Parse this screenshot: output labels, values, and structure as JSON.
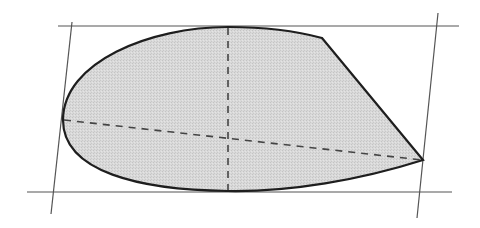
{
  "diagram": {
    "colors": {
      "background": "#ffffff",
      "shape_fill": "#d6d6d6",
      "shape_outline": "#1e1e1e",
      "frame_lines": "#555555",
      "axis_dash": "#444444"
    },
    "frame": {
      "top_line": {
        "x1": 58,
        "y1": 26,
        "x2": 459,
        "y2": 26
      },
      "bottom_line": {
        "x1": 27,
        "y1": 192,
        "x2": 452,
        "y2": 192
      },
      "left_line": {
        "x1": 72,
        "y1": 22,
        "x2": 51,
        "y2": 214
      },
      "right_line": {
        "x1": 438,
        "y1": 13,
        "x2": 417,
        "y2": 218
      }
    },
    "shape": {
      "path": "M 63 120 C 63 62 150 27 228 27 C 270 27 300 32 322 38 L 423 160 C 360 180 290 192 228 191 C 140 190 63 172 63 120 Z"
    },
    "axes": {
      "vertical": {
        "x1": 228,
        "y1": 28,
        "x2": 228,
        "y2": 190
      },
      "horizontal": {
        "x1": 64,
        "y1": 120,
        "x2": 422,
        "y2": 160
      }
    }
  }
}
